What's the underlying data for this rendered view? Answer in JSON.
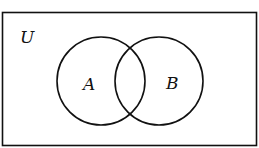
{
  "diagram": {
    "type": "venn",
    "universe_label": "U",
    "sets": [
      {
        "label": "A"
      },
      {
        "label": "B"
      }
    ],
    "stroke_color": "#111111",
    "background": "#ffffff"
  }
}
